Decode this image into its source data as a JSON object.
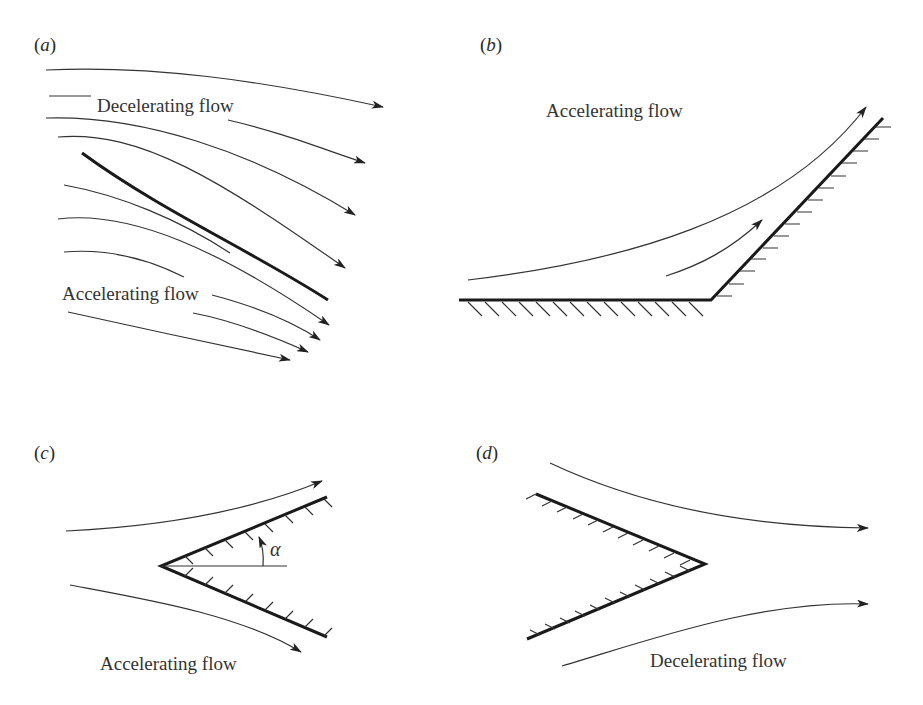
{
  "figure": {
    "panels": [
      {
        "id": "a",
        "label_open": "(",
        "label_letter": "a",
        "label_close": ")",
        "labels": [
          "Decelerating flow",
          "Accelerating flow"
        ],
        "description": "Streamlines over an inclined thin plate"
      },
      {
        "id": "b",
        "label_open": "(",
        "label_letter": "b",
        "label_close": ")",
        "labels": [
          "Accelerating flow"
        ],
        "description": "Flow along a wall turning upward (concave corner)"
      },
      {
        "id": "c",
        "label_open": "(",
        "label_letter": "c",
        "label_close": ")",
        "labels": [
          "Accelerating flow"
        ],
        "angle_symbol": "α",
        "description": "Flow past a wedge pointing upstream with half-angle α"
      },
      {
        "id": "d",
        "label_open": "(",
        "label_letter": "d",
        "label_close": ")",
        "labels": [
          "Decelerating flow"
        ],
        "description": "Flow past a wedge pointing downstream"
      }
    ]
  }
}
